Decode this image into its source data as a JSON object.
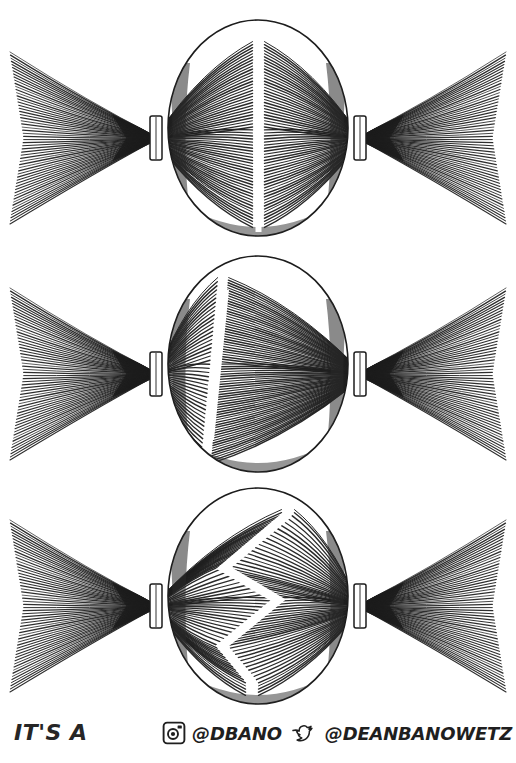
{
  "document": {
    "title": "Hair Parting Styles Diagram",
    "background_color": "#ffffff",
    "ink_color": "#1f1f1f",
    "style": "pen-and-ink hatching illustration"
  },
  "panels": [
    {
      "index": 1,
      "name": "straight-center-part",
      "label": "Straight center part with two pigtails",
      "part_style": "straight",
      "part_description": "A perfectly vertical center part running from the hairline to the nape",
      "pigtails": 2
    },
    {
      "index": 2,
      "name": "side-part",
      "label": "Off-center side part with two pigtails",
      "part_style": "side",
      "part_description": "An angled part set to the left of center, slanting from upper right to lower left",
      "pigtails": 2
    },
    {
      "index": 3,
      "name": "zigzag-part",
      "label": "Zigzag part with two pigtails",
      "part_style": "zigzag",
      "part_description": "A sharp lightning-bolt zigzag part running down the center of the scalp",
      "pigtails": 2
    }
  ],
  "footer": {
    "caption": "IT'S A",
    "social": [
      {
        "icon": "instagram-icon",
        "handle": "@DBANO"
      },
      {
        "icon": "twitter-bird-icon",
        "handle": "@DEANBANOWETZ"
      }
    ]
  }
}
